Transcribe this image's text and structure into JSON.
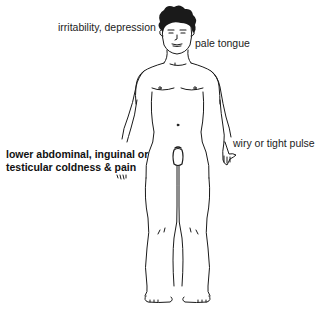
{
  "diagram": {
    "type": "anatomical-symptom-map",
    "labels": {
      "head": "irritability, depression",
      "tongue": "pale tongue",
      "pulse": "wiry or tight pulse",
      "abdominal_line1": "lower abdominal, inguinal or",
      "abdominal_line2": "testicular coldness & pain"
    },
    "colors": {
      "background": "#ffffff",
      "line": "#1a1a1a",
      "text": "#222222"
    }
  }
}
